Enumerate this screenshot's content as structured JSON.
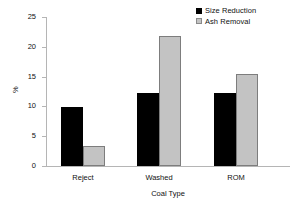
{
  "chart_data": {
    "type": "bar",
    "title": "",
    "xlabel": "Coal Type",
    "ylabel": "%",
    "categories": [
      "Reject",
      "Washed",
      "ROM"
    ],
    "series": [
      {
        "name": "Size Reduction",
        "color": "#000000",
        "values": [
          9.9,
          12.3,
          12.2
        ]
      },
      {
        "name": "Ash Removal",
        "color": "#c3c3c3",
        "values": [
          3.3,
          21.8,
          15.5
        ]
      }
    ],
    "ylim": [
      0,
      25
    ],
    "yticks": [
      0,
      5,
      10,
      15,
      20,
      25
    ],
    "ytick_labels": [
      "0",
      "5",
      "10",
      "15",
      "20",
      "25"
    ],
    "grid": false,
    "legend_position": "top-right"
  },
  "legend": {
    "items": [
      {
        "label": "Size Reduction",
        "swatch": "legend-swatch-dark"
      },
      {
        "label": "Ash Removal",
        "swatch": "legend-swatch-light"
      }
    ]
  }
}
